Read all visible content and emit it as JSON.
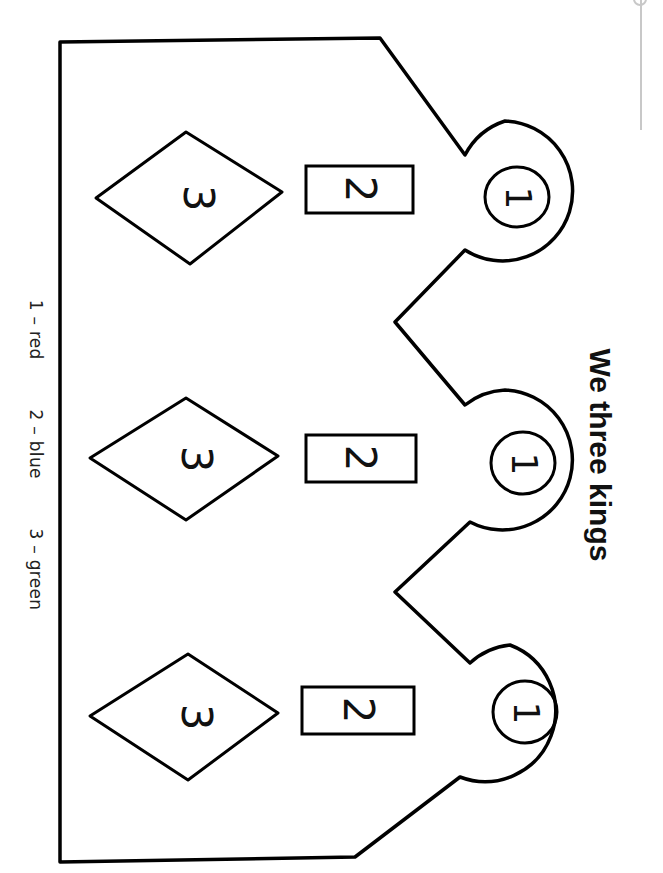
{
  "worksheet": {
    "title": "We three kings",
    "key": [
      {
        "number": "1",
        "color": "red"
      },
      {
        "number": "2",
        "color": "blue"
      },
      {
        "number": "3",
        "color": "green"
      }
    ],
    "key_labels": [
      "1 – red",
      "2 – blue",
      "3 – green"
    ],
    "crown_points": [
      {
        "circle_label": "1",
        "rect_label": "2",
        "diamond_label": "3"
      },
      {
        "circle_label": "1",
        "rect_label": "2",
        "diamond_label": "3"
      },
      {
        "circle_label": "1",
        "rect_label": "2",
        "diamond_label": "3"
      }
    ]
  }
}
